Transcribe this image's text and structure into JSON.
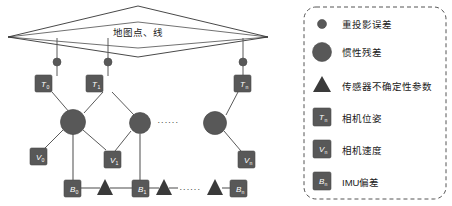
{
  "figure": {
    "type": "factor-graph-diagram",
    "background": "#ffffff",
    "node_fill": "#585858",
    "node_stroke": "#4a4a4a",
    "edge_color": "#5a5a5a",
    "map_stroke": "#333333",
    "legend_border": "#555555",
    "text_color": "#1a1a1a"
  },
  "map_region": {
    "label": "地图点、线",
    "shape": "diamond"
  },
  "graph": {
    "reprojection_dots": [
      {
        "id": "dot-0",
        "x": 57,
        "y": 62
      },
      {
        "id": "dot-1",
        "x": 108,
        "y": 62
      },
      {
        "id": "dot-n",
        "x": 243,
        "y": 62
      }
    ],
    "pose_nodes": [
      {
        "id": "T0",
        "symbol": "T",
        "sub": "0",
        "x": 44,
        "y": 75
      },
      {
        "id": "T1",
        "symbol": "T",
        "sub": "1",
        "x": 95,
        "y": 75
      },
      {
        "id": "Tn",
        "symbol": "T",
        "sub": "n",
        "x": 230,
        "y": 75
      }
    ],
    "inertial_nodes": [
      {
        "id": "I0",
        "x": 73,
        "y": 120
      },
      {
        "id": "I1",
        "x": 140,
        "y": 122
      },
      {
        "id": "In",
        "x": 215,
        "y": 122
      }
    ],
    "velocity_nodes": [
      {
        "id": "V0",
        "symbol": "V",
        "sub": "0",
        "x": 30,
        "y": 147
      },
      {
        "id": "V1",
        "symbol": "V",
        "sub": "1",
        "x": 100,
        "y": 150
      },
      {
        "id": "Vn",
        "symbol": "V",
        "sub": "n",
        "x": 238,
        "y": 150
      }
    ],
    "bias_nodes": [
      {
        "id": "B0",
        "symbol": "B",
        "sub": "0",
        "x": 66,
        "y": 180
      },
      {
        "id": "B1",
        "symbol": "B",
        "sub": "1",
        "x": 136,
        "y": 180
      },
      {
        "id": "Bn",
        "symbol": "B",
        "sub": "n",
        "x": 232,
        "y": 180
      }
    ],
    "uncertainty_triangles": [
      {
        "id": "tri-0",
        "x": 104,
        "y": 188
      },
      {
        "id": "tri-1",
        "x": 163,
        "y": 188
      },
      {
        "id": "tri-n",
        "x": 216,
        "y": 188
      }
    ],
    "ellipsis": [
      {
        "id": "ellipsis-middle",
        "text": "······",
        "x": 168,
        "y": 122
      },
      {
        "id": "ellipsis-bottom",
        "text": "······",
        "x": 188,
        "y": 190
      }
    ]
  },
  "legend": {
    "items": [
      {
        "glyph": "small-circle",
        "label": "重投影误差"
      },
      {
        "glyph": "large-circle",
        "label": "惯性残差"
      },
      {
        "glyph": "triangle",
        "label": "传感器不确定性参数"
      },
      {
        "glyph": "square",
        "symbol": "T",
        "sub": "n",
        "label": "相机位姿"
      },
      {
        "glyph": "square",
        "symbol": "V",
        "sub": "n",
        "label": "相机速度"
      },
      {
        "glyph": "square",
        "symbol": "B",
        "sub": "n",
        "label": "IMU偏差"
      }
    ]
  }
}
